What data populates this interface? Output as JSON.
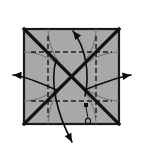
{
  "figure": {
    "width": 144,
    "height": 152,
    "background_color": "#ffffff"
  },
  "paper": {
    "label": "square-sheet",
    "fill_color": "#a8a8a8",
    "edge_color": "#1a1a1a",
    "x": 24,
    "y": 29,
    "width": 95,
    "height": 95,
    "edge_width": 2.2
  },
  "creases": {
    "diagonal_color": "#111111",
    "diagonal_width": 3.2,
    "dashed_color": "#1e1e1e",
    "dashed_width": 1.5,
    "dash_pattern": "5,3",
    "arc_color": "#6e6e6e",
    "arc_width": 1.0,
    "diagonals": [
      {
        "name": "crease-diagonal-tl-br",
        "x1": 24,
        "y1": 29,
        "x2": 119,
        "y2": 124
      },
      {
        "name": "crease-diagonal-tr-bl",
        "x1": 119,
        "y1": 29,
        "x2": 24,
        "y2": 124
      }
    ],
    "dashed_lines": [
      {
        "name": "crease-dashed-horizontal-upper",
        "x1": 31,
        "y1": 52,
        "x2": 112,
        "y2": 52
      },
      {
        "name": "crease-dashed-horizontal-lower",
        "x1": 31,
        "y1": 101,
        "x2": 112,
        "y2": 101
      },
      {
        "name": "crease-dashed-vertical-left",
        "x1": 48,
        "y1": 36,
        "x2": 48,
        "y2": 117
      },
      {
        "name": "crease-dashed-vertical-right",
        "x1": 96,
        "y1": 36,
        "x2": 96,
        "y2": 117
      }
    ],
    "arcs": [
      {
        "name": "crease-arc-top-left",
        "d": "M 48 29 C 48 48 58 64 71 76"
      },
      {
        "name": "crease-arc-top-right",
        "d": "M 96 29 C 96 48 85 64 71 76"
      },
      {
        "name": "crease-arc-bottom-left",
        "d": "M 48 124 C 48 105 58 89 71 76"
      },
      {
        "name": "crease-arc-bottom-right",
        "d": "M 96 124 C 96 105 85 89 71 76"
      },
      {
        "name": "crease-arc-left-top",
        "d": "M 24 52 C 42 52 59 63 71 76"
      },
      {
        "name": "crease-arc-left-bottom",
        "d": "M 24 101 C 42 101 59 89 71 76"
      },
      {
        "name": "crease-arc-right-top",
        "d": "M 119 52 C 101 52 84 63 71 76"
      },
      {
        "name": "crease-arc-right-bottom",
        "d": "M 119 101 C 101 101 84 89 71 76"
      }
    ],
    "center_point": {
      "name": "crease-center",
      "x": 71,
      "y": 76
    }
  },
  "arrows": {
    "color": "#0d0d0d",
    "stroke_width": 1.6,
    "head_size": 5,
    "items": [
      {
        "name": "arrow-up",
        "direction": "up",
        "path": "M 85 96 C 90 74 86 48 73 31",
        "tip_x": 73,
        "tip_y": 31,
        "angle_deg": -128
      },
      {
        "name": "arrow-down",
        "direction": "down",
        "path": "M 56 60 C 50 82 56 112 72 142",
        "tip_x": 72,
        "tip_y": 142,
        "angle_deg": 62
      },
      {
        "name": "arrow-left",
        "direction": "left",
        "path": "M 57 90 C 42 84 26 76 13 75",
        "tip_x": 13,
        "tip_y": 75,
        "angle_deg": 184
      },
      {
        "name": "arrow-right",
        "direction": "right",
        "path": "M 84 90 C 100 84 118 77 131 75",
        "tip_x": 131,
        "tip_y": 75,
        "angle_deg": -8
      }
    ]
  },
  "markers": {
    "color": "#111111",
    "items": [
      {
        "name": "reference-point-circle",
        "shape": "circle",
        "cx": 88,
        "cy": 121,
        "r": 2.6
      },
      {
        "name": "reference-point-square",
        "shape": "square",
        "x": 84,
        "y": 103,
        "size": 4
      },
      {
        "name": "reference-connector",
        "shape": "line",
        "x1": 86,
        "y1": 107,
        "x2": 88,
        "y2": 118
      }
    ]
  }
}
